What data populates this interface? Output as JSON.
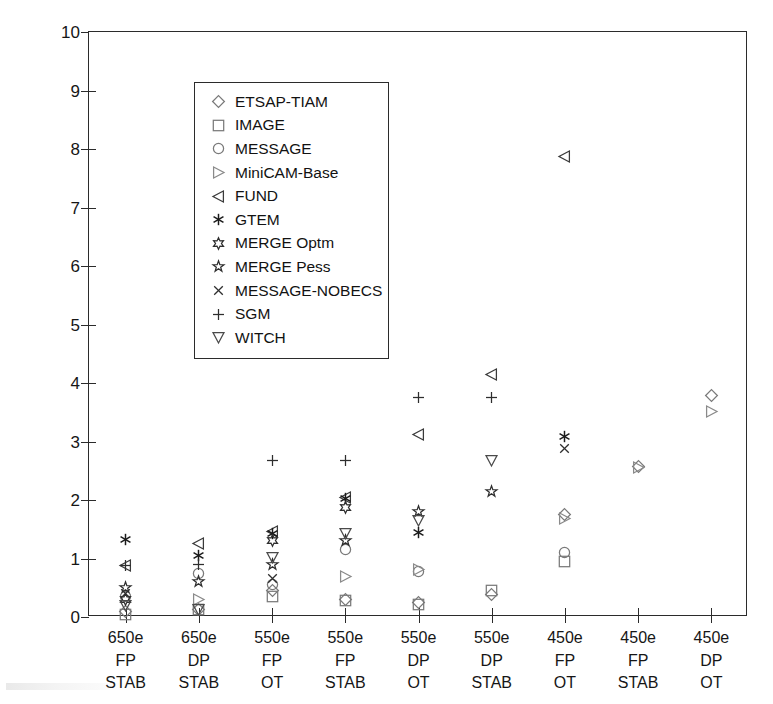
{
  "chart_data": {
    "type": "scatter",
    "title": "",
    "xlabel": "",
    "ylabel": "% Losses of world GDP, in NPV",
    "ylim": [
      0,
      10
    ],
    "yticks": [
      0,
      1,
      2,
      3,
      4,
      5,
      6,
      7,
      8,
      9,
      10
    ],
    "ytick_labels": [
      "0",
      "1",
      "2",
      "3",
      "4",
      "5",
      "6",
      "7",
      "8",
      "9",
      "10"
    ],
    "grid": false,
    "legend_position": "upper left",
    "categories": [
      {
        "line1": "650e",
        "line2": "FP",
        "line3": "STAB"
      },
      {
        "line1": "650e",
        "line2": "DP",
        "line3": "STAB"
      },
      {
        "line1": "550e",
        "line2": "FP",
        "line3": "OT"
      },
      {
        "line1": "550e",
        "line2": "FP",
        "line3": "STAB"
      },
      {
        "line1": "550e",
        "line2": "DP",
        "line3": "OT"
      },
      {
        "line1": "550e",
        "line2": "DP",
        "line3": "STAB"
      },
      {
        "line1": "450e",
        "line2": "FP",
        "line3": "OT"
      },
      {
        "line1": "450e",
        "line2": "FP",
        "line3": "STAB"
      },
      {
        "line1": "450e",
        "line2": "DP",
        "line3": "OT"
      }
    ],
    "category_labels": [
      "650e FP STAB",
      "650e DP STAB",
      "550e FP OT",
      "550e FP STAB",
      "550e DP OT",
      "550e DP STAB",
      "450e FP OT",
      "450e FP STAB",
      "450e DP OT"
    ],
    "series": [
      {
        "name": "ETSAP-TIAM",
        "marker": "diamond",
        "color": "#7a7a7a",
        "values": [
          0.1,
          0.12,
          0.45,
          0.3,
          0.25,
          0.38,
          1.75,
          2.57,
          3.78
        ]
      },
      {
        "name": "IMAGE",
        "marker": "square",
        "color": "#7a7a7a",
        "values": [
          0.05,
          0.12,
          0.35,
          0.28,
          0.22,
          0.45,
          0.95,
          null,
          null
        ]
      },
      {
        "name": "MESSAGE",
        "marker": "circle",
        "color": "#7a7a7a",
        "values": [
          0.35,
          0.75,
          0.55,
          1.15,
          0.78,
          null,
          1.1,
          null,
          null
        ]
      },
      {
        "name": "MiniCAM-Base",
        "marker": "triangle-right",
        "color": "#8a8a8a",
        "values": [
          null,
          0.3,
          null,
          0.7,
          0.82,
          null,
          1.68,
          2.56,
          3.52
        ]
      },
      {
        "name": "FUND",
        "marker": "triangle-left",
        "color": "#3a3a3a",
        "values": [
          0.88,
          1.25,
          1.47,
          2.05,
          3.12,
          4.15,
          7.88,
          null,
          null
        ]
      },
      {
        "name": "GTEM",
        "marker": "asterisk",
        "color": "#1a1a1a",
        "values": [
          1.32,
          1.05,
          1.42,
          2.02,
          1.45,
          null,
          3.08,
          null,
          null
        ]
      },
      {
        "name": "MERGE Optm",
        "marker": "hexagram",
        "color": "#2e2e2e",
        "values": [
          0.3,
          null,
          1.3,
          1.88,
          null,
          null,
          null,
          null,
          null
        ]
      },
      {
        "name": "MERGE Pess",
        "marker": "pentagram",
        "color": "#2e2e2e",
        "values": [
          0.5,
          0.6,
          0.9,
          1.3,
          1.8,
          2.15,
          null,
          null,
          null
        ]
      },
      {
        "name": "MESSAGE-NOBECS",
        "marker": "cross",
        "color": "#2e2e2e",
        "values": [
          0.4,
          null,
          0.65,
          null,
          null,
          null,
          2.88,
          null,
          null
        ]
      },
      {
        "name": "SGM",
        "marker": "plus",
        "color": "#2e2e2e",
        "values": [
          0.88,
          0.9,
          2.68,
          2.68,
          3.75,
          3.75,
          null,
          null,
          null
        ]
      },
      {
        "name": "WITCH",
        "marker": "triangle-down",
        "color": "#4a4a4a",
        "values": [
          0.2,
          0.12,
          1.02,
          1.42,
          1.65,
          2.68,
          null,
          null,
          null
        ]
      }
    ]
  },
  "legend": {
    "items": [
      {
        "label": "ETSAP-TIAM",
        "marker": "diamond"
      },
      {
        "label": "IMAGE",
        "marker": "square"
      },
      {
        "label": "MESSAGE",
        "marker": "circle"
      },
      {
        "label": "MiniCAM-Base",
        "marker": "triangle-right"
      },
      {
        "label": "FUND",
        "marker": "triangle-left"
      },
      {
        "label": "GTEM",
        "marker": "asterisk"
      },
      {
        "label": "MERGE Optm",
        "marker": "hexagram"
      },
      {
        "label": "MERGE Pess",
        "marker": "pentagram"
      },
      {
        "label": "MESSAGE-NOBECS",
        "marker": "cross"
      },
      {
        "label": "SGM",
        "marker": "plus"
      },
      {
        "label": "WITCH",
        "marker": "triangle-down"
      }
    ]
  },
  "axes": {
    "y_title": "% Losses of world GDP, in NPV"
  }
}
